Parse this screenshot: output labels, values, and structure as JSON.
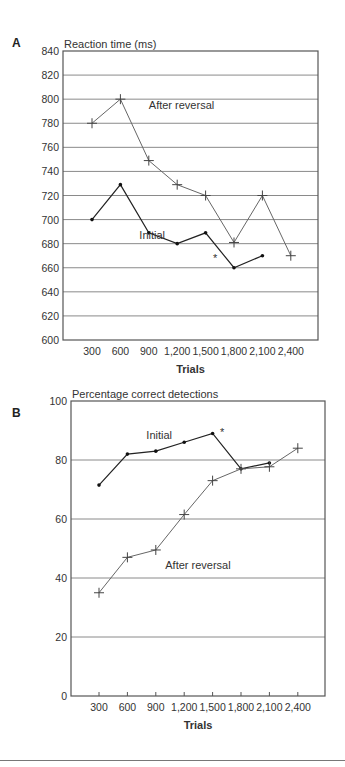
{
  "chart_data": [
    {
      "panel": "A",
      "type": "line",
      "title": "",
      "ylabel": "Reaction time (ms)",
      "xlabel": "Trials",
      "ylim": [
        600,
        840
      ],
      "yticks": [
        600,
        620,
        640,
        660,
        680,
        700,
        720,
        740,
        760,
        780,
        800,
        820,
        840
      ],
      "categories": [
        "300",
        "600",
        "900",
        "1,200",
        "1,500",
        "1,800",
        "2,100",
        "2,400"
      ],
      "grid": true,
      "series": [
        {
          "name": "After reversal",
          "marker": "plus",
          "color": "#666666",
          "values": [
            780,
            800,
            749,
            729,
            720,
            681,
            720,
            670
          ]
        },
        {
          "name": "Initial",
          "marker": "dot",
          "color": "#222222",
          "values": [
            700,
            729,
            689,
            680,
            689,
            660,
            670,
            null
          ]
        }
      ],
      "annotations": [
        {
          "text": "After reversal",
          "x": 900,
          "y": 792
        },
        {
          "text": "Initial",
          "x": 800,
          "y": 684
        },
        {
          "text": "*",
          "x": 1600,
          "y": 665
        }
      ]
    },
    {
      "panel": "B",
      "type": "line",
      "title": "",
      "ylabel": "Percentage correct detections",
      "xlabel": "Trials",
      "ylim": [
        0,
        100
      ],
      "yticks": [
        0,
        20,
        40,
        60,
        80,
        100
      ],
      "categories": [
        "300",
        "600",
        "900",
        "1,200",
        "1,500",
        "1,800",
        "2,100",
        "2,400"
      ],
      "grid": true,
      "series": [
        {
          "name": "Initial",
          "marker": "dot",
          "color": "#222222",
          "values": [
            71.5,
            82,
            83,
            86,
            89,
            77,
            79,
            null
          ]
        },
        {
          "name": "After reversal",
          "marker": "plus",
          "color": "#666666",
          "values": [
            35,
            47,
            49.5,
            61.5,
            73,
            77,
            77.7,
            84
          ]
        }
      ],
      "annotations": [
        {
          "text": "Initial",
          "x": 800,
          "y": 87
        },
        {
          "text": "*",
          "x": 1600,
          "y": 88
        },
        {
          "text": "After reversal",
          "x": 1000,
          "y": 43
        }
      ]
    }
  ],
  "panels": {
    "a": {
      "letter": "A",
      "ylabel": "Reaction time (ms)",
      "xlabel": "Trials",
      "label_after": "After reversal",
      "label_initial": "Initial",
      "star": "*"
    },
    "b": {
      "letter": "B",
      "ylabel": "Percentage correct detections",
      "xlabel": "Trials",
      "label_after": "After reversal",
      "label_initial": "Initial",
      "star": "*"
    }
  }
}
